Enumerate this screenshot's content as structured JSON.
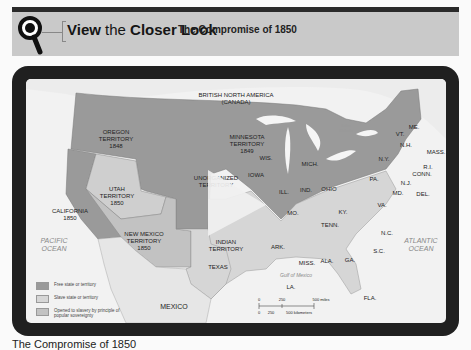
{
  "header": {
    "title_bold_1": "View",
    "title_mid": " the ",
    "title_bold_2": "Closer Look",
    "subtitle": "The Compromise of 1850",
    "icon": "magnifier-icon"
  },
  "media": {
    "play_icon": "play-icon",
    "colors": {
      "free": "#9a9a9a",
      "slave": "#d6d6d6",
      "popular_sovereignty": "#c2c2c2",
      "frame": "#202020",
      "header_bg": "#c9c9c9"
    }
  },
  "map": {
    "labels": {
      "canada": "BRITISH NORTH AMERICA",
      "canada_sub": "(CANADA)",
      "oregon": [
        "OREGON",
        "TERRITORY",
        "1848"
      ],
      "minnesota": [
        "MINNESOTA",
        "TERRITORY",
        "1849"
      ],
      "unorganized": [
        "UNORGANIZED",
        "TERRITORY"
      ],
      "utah": [
        "UTAH",
        "TERRITORY",
        "1850"
      ],
      "california": [
        "CALIFORNIA",
        "1850"
      ],
      "new_mexico": [
        "NEW MEXICO",
        "TERRITORY",
        "1850"
      ],
      "indian": [
        "INDIAN",
        "TERRITORY"
      ],
      "texas": "TEXAS",
      "mexico": "MEXICO",
      "lake_ontario": [
        "Lake",
        "Ontario"
      ],
      "pacific": [
        "PACIFIC",
        "OCEAN"
      ],
      "atlantic": [
        "ATLANTIC",
        "OCEAN"
      ],
      "gulf": "Gulf of Mexico",
      "states": {
        "wis": "WIS.",
        "mich": "MICH.",
        "iowa": "IOWA",
        "ill": "ILL.",
        "ind": "IND.",
        "ohio": "OHIO",
        "pa": "PA.",
        "ny": "N.Y.",
        "vt": "VT.",
        "nh": "N.H.",
        "me": "ME.",
        "mass": "MASS.",
        "ri": "R.I.",
        "conn": "CONN.",
        "nj": "N.J.",
        "md": "MD.",
        "del": "DEL.",
        "va": "VA.",
        "ky": "KY.",
        "mo": "MO.",
        "tenn": "TENN.",
        "nc": "N.C.",
        "sc": "S.C.",
        "ark": "ARK.",
        "miss": "MISS.",
        "ala": "ALA.",
        "ga": "GA.",
        "la": "LA.",
        "fla": "FLA."
      }
    },
    "scale": {
      "miles": [
        "0",
        "250",
        "500 miles"
      ],
      "km": [
        "0",
        "250",
        "500 kilometers"
      ]
    },
    "legend": [
      {
        "label": "Free state or territory",
        "color": "#9a9a9a"
      },
      {
        "label": "Slave state or territory",
        "color": "#d6d6d6"
      },
      {
        "label": "Opened to slavery by principle of popular sovereignty",
        "color": "#c2c2c2"
      }
    ]
  },
  "caption": "The Compromise of 1850"
}
